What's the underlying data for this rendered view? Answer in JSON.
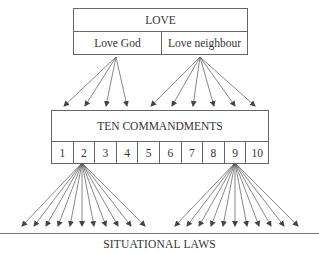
{
  "love_box": {
    "title": "LOVE",
    "children": [
      "Love God",
      "Love neighbour"
    ]
  },
  "commandments_box": {
    "title": "TEN COMMANDMENTS",
    "numbers": [
      "1",
      "2",
      "3",
      "4",
      "5",
      "6",
      "7",
      "8",
      "9",
      "10"
    ]
  },
  "footer": {
    "label": "SITUATIONAL LAWS"
  },
  "arrows": {
    "love_god_to_commandments": 4,
    "love_neighbour_to_commandments": 6,
    "commandment_2_to_laws": 11,
    "commandment_9_to_laws": 11
  },
  "colors": {
    "line": "#555555",
    "text": "#333333"
  }
}
